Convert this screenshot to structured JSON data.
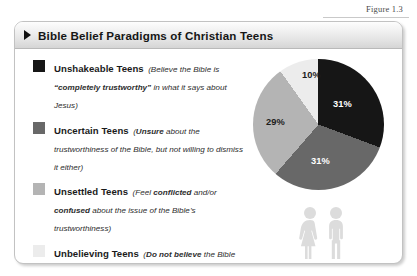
{
  "figure": {
    "caption": "Figure 1.3"
  },
  "card": {
    "header": {
      "bullet_icon": "triangle-right-icon",
      "title": "Bible Belief Paradigms of Christian Teens"
    }
  },
  "legend": {
    "items": [
      {
        "swatch_color": "#161616",
        "title": "Unshakeable Teens",
        "desc_parts": [
          {
            "text": "(Believe the Bible is ",
            "bold": false
          },
          {
            "text": "“completely trustworthy”",
            "bold": true
          },
          {
            "text": " in what it says about Jesus)",
            "bold": false
          }
        ],
        "desc_plain": "(Believe the Bible is “completely trustworthy” in what it says about Jesus)"
      },
      {
        "swatch_color": "#686868",
        "title": "Uncertain Teens",
        "desc_parts": [
          {
            "text": "(",
            "bold": false
          },
          {
            "text": "Unsure",
            "bold": true
          },
          {
            "text": " about the trustworthiness of the Bible, but not willing to dismiss it either)",
            "bold": false
          }
        ],
        "desc_plain": "(Unsure about the trustworthiness of the Bible, but not willing to dismiss it either)"
      },
      {
        "swatch_color": "#b4b4b4",
        "title": "Unsettled Teens",
        "desc_parts": [
          {
            "text": "(Feel ",
            "bold": false
          },
          {
            "text": "conflicted",
            "bold": true
          },
          {
            "text": " and/or ",
            "bold": false
          },
          {
            "text": "confused",
            "bold": true
          },
          {
            "text": " about the issue of the Bible’s trustworthiness)",
            "bold": false
          }
        ],
        "desc_plain": "(Feel conflicted and/or confused about the issue of the Bible’s trustworthiness)"
      },
      {
        "swatch_color": "#ececec",
        "title": "Unbelieving Teens",
        "desc_parts": [
          {
            "text": "(",
            "bold": false
          },
          {
            "text": "Do not believe",
            "bold": true
          },
          {
            "text": " the Bible can be trusted in everything it says about Jesus)",
            "bold": false
          }
        ],
        "desc_plain": "(Do not believe the Bible can be trusted in everything it says about Jesus)"
      }
    ]
  },
  "chart_data": {
    "type": "pie",
    "title": "Bible Belief Paradigms of Christian Teens",
    "categories": [
      "Unshakeable Teens",
      "Uncertain Teens",
      "Unsettled Teens",
      "Unbelieving Teens"
    ],
    "values": [
      31,
      31,
      29,
      10
    ],
    "labels": [
      "31%",
      "31%",
      "29%",
      "10%"
    ],
    "colors": [
      "#161616",
      "#686868",
      "#b4b4b4",
      "#ececec"
    ],
    "label_colors": [
      "#ffffff",
      "#ffffff",
      "#1c1c1c",
      "#1c1c1c"
    ],
    "units": "percent",
    "start_angle_deg": 0,
    "direction": "clockwise",
    "legend": "left",
    "grid": false
  },
  "decoration": {
    "people_icon": "two-people-icon"
  }
}
